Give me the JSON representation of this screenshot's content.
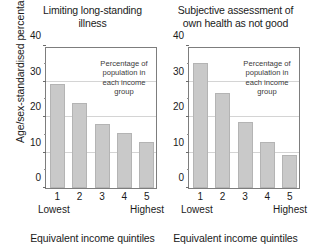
{
  "chart_data": [
    {
      "type": "bar",
      "panel": "left",
      "title": "Limiting long-standing illness",
      "title_lines": [
        "Limiting long-standing",
        "illness"
      ],
      "categories": [
        "1",
        "2",
        "3",
        "4",
        "5"
      ],
      "values": [
        29.3,
        24.0,
        18.0,
        15.4,
        13.0
      ],
      "xlabel": "Equivalent income quintiles",
      "ylabel": "Age/sex-standardised percentage",
      "ylim": [
        0,
        40
      ],
      "yticks": [
        0,
        10,
        20,
        30,
        40
      ],
      "ytick_labels": [
        "0",
        "10",
        "20",
        "30",
        "40"
      ],
      "xtick_low_label": "Lowest",
      "xtick_high_label": "Highest",
      "grid": true,
      "annotation": "Percentage of population in each income group",
      "annotation_lines": [
        "Percentage of",
        "population in",
        "each income",
        "group"
      ],
      "bar_color": "#c9c9c9",
      "bar_border_color": "#b4b4b4",
      "axis_color": "#7d7d7d"
    },
    {
      "type": "bar",
      "panel": "right",
      "title": "Subjective assessment of own health as not good",
      "title_lines": [
        "Subjective assessment of",
        "own health as not good"
      ],
      "categories": [
        "1",
        "2",
        "3",
        "4",
        "5"
      ],
      "values": [
        35.1,
        26.7,
        18.5,
        12.9,
        9.4
      ],
      "xlabel": "Equivalent income quintiles",
      "ylabel": "Age/sex-standardised percentage",
      "ylim": [
        0,
        40
      ],
      "yticks": [
        0,
        10,
        20,
        30,
        40
      ],
      "ytick_labels": [
        "0",
        "10",
        "20",
        "30",
        "40"
      ],
      "xtick_low_label": "Lowest",
      "xtick_high_label": "Highest",
      "grid": true,
      "annotation": "Percentage of population in each income group",
      "annotation_lines": [
        "Percentage of",
        "population in",
        "each income",
        "group"
      ],
      "bar_color": "#c9c9c9",
      "bar_border_color": "#b4b4b4",
      "axis_color": "#7d7d7d"
    }
  ],
  "shared": {
    "ylabel": "Age/sex-standardised percentage"
  }
}
